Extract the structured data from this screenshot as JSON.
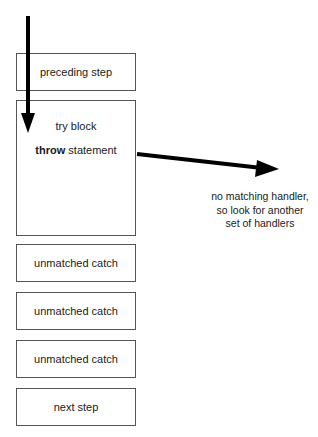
{
  "diagram": {
    "boxes": {
      "preceding": {
        "label": "preceding step"
      },
      "try": {
        "line1": "try block",
        "line2_bold": "throw",
        "line2_rest": " statement"
      },
      "catch1": {
        "label": "unmatched catch"
      },
      "catch2": {
        "label": "unmatched catch"
      },
      "catch3": {
        "label": "unmatched catch"
      },
      "next": {
        "label": "next step"
      }
    },
    "annotation": {
      "line1": "no matching handler,",
      "line2": "so look for another",
      "line3": "set of handlers"
    },
    "colors": {
      "arrow": "#000000",
      "border": "#555555",
      "text": "#1a1a1a"
    }
  }
}
